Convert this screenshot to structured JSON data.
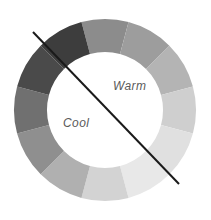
{
  "figure": {
    "name": "color-wheel-warm-cool",
    "background": "#ffffff",
    "width": 211,
    "height": 220
  },
  "labels": {
    "warm": "Warm",
    "cool": "Cool",
    "text_color": "#5a5a5a"
  },
  "divider": {
    "name": "warm-cool-divider-line",
    "color": "#1a1a1a",
    "stroke_width": 2,
    "x1": 33,
    "y1": 32,
    "x2": 179,
    "y2": 184
  },
  "chart_data": {
    "type": "pie",
    "title": "",
    "subtitle": "",
    "xlabel": "",
    "ylabel": "",
    "legend_position": "none",
    "grid": false,
    "shape": "donut",
    "center_x": 105,
    "center_y": 110,
    "outer_radius": 91,
    "inner_radius": 58,
    "segment_count": 12,
    "segment_degrees": 30,
    "start_angle_deg": -105,
    "categories": [
      "seg-1",
      "seg-2",
      "seg-3",
      "seg-4",
      "seg-5",
      "seg-6",
      "seg-7",
      "seg-8",
      "seg-9",
      "seg-10",
      "seg-11",
      "seg-12"
    ],
    "values": [
      30,
      30,
      30,
      30,
      30,
      30,
      30,
      30,
      30,
      30,
      30,
      30
    ],
    "colors": [
      "#8c8c8c",
      "#9d9d9d",
      "#b4b4b4",
      "#cfcfcf",
      "#e0e0e0",
      "#e8e8e8",
      "#d3d3d3",
      "#b0b0b0",
      "#8f8f8f",
      "#707070",
      "#4a4a4a",
      "#3d3d3d"
    ],
    "divider_angle_deg": 46,
    "halves": [
      {
        "name": "Warm",
        "side": "upper-right"
      },
      {
        "name": "Cool",
        "side": "lower-left"
      }
    ]
  }
}
